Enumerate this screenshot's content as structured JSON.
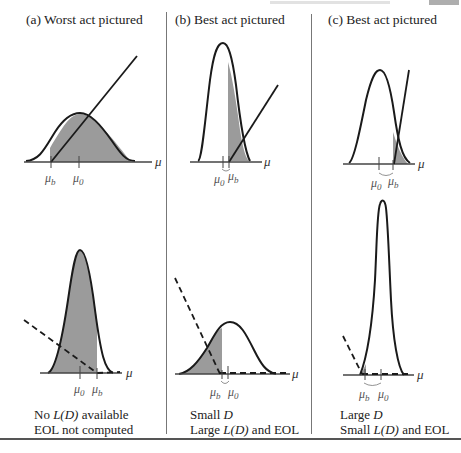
{
  "figure": {
    "panels": [
      {
        "id": "a",
        "title": "(a)  Worst act pictured",
        "top_plot": {
          "axis_label": "μ",
          "tick_labels": [
            "μ_b",
            "μ_0"
          ],
          "tick_display": [
            "μb",
            "μ0"
          ],
          "shading": "right of μ_b",
          "loss_line": "solid, rising"
        },
        "bottom_plot": {
          "axis_label": "μ",
          "tick_labels": [
            "μ_0",
            "μ_b"
          ],
          "tick_display": [
            "μ0",
            "μb"
          ],
          "shading": "left of μ_b",
          "loss_line": "dashed, falling"
        },
        "caption": {
          "line1_prefix": "No ",
          "line1_em": "L(D)",
          "line1_suffix": " available",
          "line2": "EOL not computed"
        }
      },
      {
        "id": "b",
        "title": "(b)  Best act pictured",
        "top_plot": {
          "axis_label": "μ",
          "tick_labels": [
            "μ_0",
            "μ_b"
          ],
          "tick_display": [
            "μ0",
            "μb"
          ],
          "shading": "right of μ_b (upper tail)",
          "loss_line": "solid, rising"
        },
        "bottom_plot": {
          "axis_label": "μ",
          "tick_labels": [
            "μ_b",
            "μ_0"
          ],
          "tick_display": [
            "μb",
            "μ0"
          ],
          "shading": "left of μ_b (lower tail)",
          "loss_line": "dashed, falling"
        },
        "caption": {
          "line1_prefix": "Small ",
          "line1_em": "D",
          "line1_suffix": "",
          "line2_prefix": "Large ",
          "line2_em": "L(D)",
          "line2_suffix": " and EOL"
        }
      },
      {
        "id": "c",
        "title": "(c)  Best act pictured",
        "top_plot": {
          "axis_label": "μ",
          "tick_labels": [
            "μ_0",
            "μ_b"
          ],
          "tick_display": [
            "μ0",
            "μb"
          ],
          "shading": "right of μ_b (small tail)",
          "loss_line": "solid, steep rising"
        },
        "bottom_plot": {
          "axis_label": "μ",
          "tick_labels": [
            "μ_b",
            "μ_0"
          ],
          "tick_display": [
            "μb",
            "μ0"
          ],
          "shading": "tiny lower tail",
          "loss_line": "dashed, falling"
        },
        "caption": {
          "line1_prefix": "Large ",
          "line1_em": "D",
          "line1_suffix": "",
          "line2_prefix": "Small ",
          "line2_em": "L(D)",
          "line2_suffix": " and EOL"
        }
      }
    ],
    "colors": {
      "shade": "#9b9b9b",
      "curve": "#1a1a1a",
      "axis": "#444444",
      "divider": "#777777"
    }
  }
}
